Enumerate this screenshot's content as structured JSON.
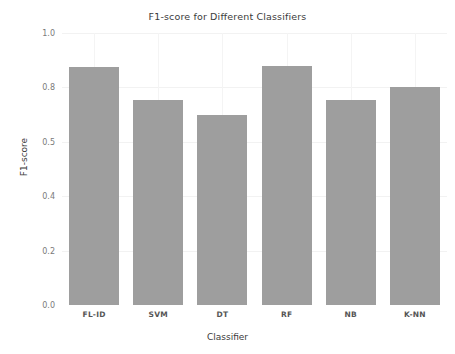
{
  "chart_data": {
    "type": "bar",
    "title": "F1-score for Different Classifiers",
    "xlabel": "Classifier",
    "ylabel": "F1-score",
    "categories": [
      "FL-ID",
      "SVM",
      "DT",
      "RF",
      "NB",
      "K-NN"
    ],
    "values": [
      0.875,
      0.755,
      0.7,
      0.88,
      0.755,
      0.8
    ],
    "ylim": [
      0.0,
      1.0
    ],
    "ytick_labels": [
      "0.0",
      "0.2",
      "0.4",
      "0.5",
      "0.8",
      "1.0"
    ],
    "ytick_positions": [
      0.0,
      0.2,
      0.4,
      0.6,
      0.8,
      1.0
    ],
    "grid": true,
    "legend": "none",
    "bar_color": "#9e9e9e",
    "background_color": "#ffffff",
    "text_color": "#3b3b3b",
    "tick_color": "#7a7a7a"
  }
}
